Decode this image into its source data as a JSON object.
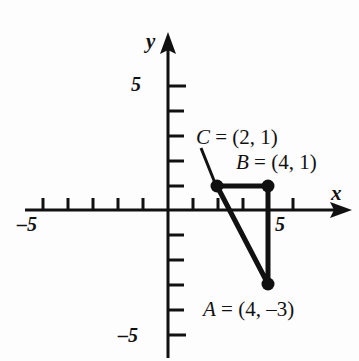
{
  "figure": {
    "axis_labels": {
      "x": "x",
      "y": "y"
    },
    "tick_labels": {
      "x_positive": "5",
      "x_negative": "–5",
      "y_positive": "5",
      "y_negative": "–5"
    },
    "point_labels": {
      "a": "A = (4, –3)",
      "b": "B = (4, 1)",
      "c": "C = (2, 1)"
    },
    "colors": {
      "ink": "#111111",
      "background": "#fdfdfd"
    }
  },
  "chart_data": {
    "type": "scatter",
    "title": "",
    "xlabel": "x",
    "ylabel": "y",
    "xlim": [
      -5.8,
      5.8
    ],
    "ylim": [
      -5.8,
      5.8
    ],
    "grid": false,
    "legend": null,
    "xticks": [
      -5,
      -4,
      -3,
      -2,
      -1,
      1,
      2,
      3,
      4,
      5
    ],
    "yticks": [
      -5,
      -4,
      -3,
      -2,
      -1,
      1,
      2,
      3,
      4,
      5
    ],
    "xticklabels": {
      "-5": "–5",
      "5": "5"
    },
    "yticklabels": {
      "-5": "–5",
      "5": "5"
    },
    "points": [
      {
        "name": "A",
        "x": 4,
        "y": -3,
        "label": "A = (4, –3)"
      },
      {
        "name": "B",
        "x": 4,
        "y": 1,
        "label": "B = (4, 1)"
      },
      {
        "name": "C",
        "x": 2,
        "y": 1,
        "label": "C = (2, 1)"
      }
    ],
    "series": [
      {
        "name": "triangle ABC",
        "type": "polygon",
        "closed": true,
        "x": [
          2,
          4,
          4
        ],
        "y": [
          1,
          1,
          -3
        ]
      }
    ],
    "annotations": [
      {
        "text": "C = (2, 1)",
        "leader_from": [
          2,
          1
        ],
        "leader_to": [
          1.3,
          2.5
        ]
      },
      {
        "text": "B = (4, 1)",
        "anchor": [
          4,
          1
        ]
      },
      {
        "text": "A = (4, –3)",
        "anchor": [
          4,
          -3
        ]
      }
    ]
  }
}
